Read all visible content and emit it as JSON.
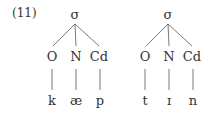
{
  "example_number": "(11)",
  "trees": [
    {
      "root": "σ",
      "nodes": [
        "O",
        "N",
        "Cd"
      ],
      "segments": [
        "k",
        "æ",
        "p"
      ]
    },
    {
      "root": "σ",
      "nodes": [
        "O",
        "N",
        "Cd"
      ],
      "segments": [
        "t",
        "ɪ",
        "n"
      ]
    }
  ]
}
